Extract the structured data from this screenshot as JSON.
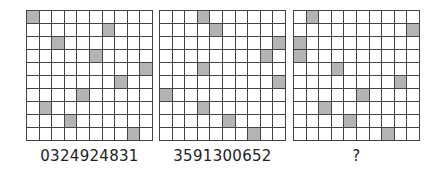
{
  "puzzle": {
    "grids": [
      {
        "label": "0324924831",
        "shaded": [
          [
            0,
            0
          ],
          [
            1,
            6
          ],
          [
            2,
            2
          ],
          [
            3,
            5
          ],
          [
            4,
            9
          ],
          [
            5,
            7
          ],
          [
            6,
            4
          ],
          [
            7,
            1
          ],
          [
            8,
            3
          ],
          [
            9,
            8
          ]
        ]
      },
      {
        "label": "3591300652",
        "shaded": [
          [
            0,
            3
          ],
          [
            1,
            4
          ],
          [
            2,
            9
          ],
          [
            3,
            8
          ],
          [
            4,
            3
          ],
          [
            5,
            9
          ],
          [
            6,
            0
          ],
          [
            7,
            3
          ],
          [
            8,
            5
          ],
          [
            9,
            7
          ]
        ]
      },
      {
        "label": "?",
        "shaded": [
          [
            0,
            1
          ],
          [
            1,
            9
          ],
          [
            2,
            0
          ],
          [
            3,
            0
          ],
          [
            4,
            3
          ],
          [
            5,
            8
          ],
          [
            6,
            5
          ],
          [
            7,
            2
          ],
          [
            8,
            4
          ],
          [
            9,
            7
          ]
        ]
      }
    ],
    "rows": 10,
    "cols": 10,
    "colors": {
      "shaded": "#b4b4b4",
      "empty": "#ffffff",
      "grid_line": "#444444"
    }
  }
}
